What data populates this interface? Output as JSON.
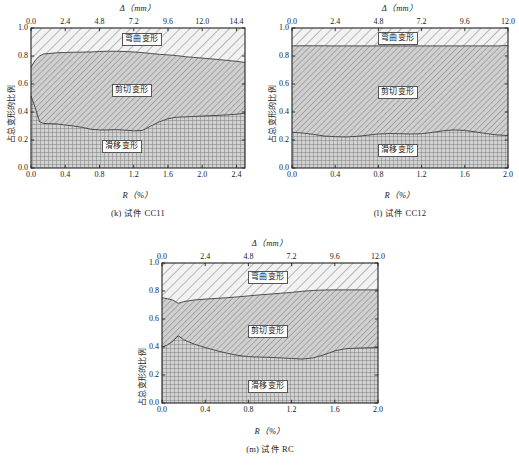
{
  "figure": {
    "panels": [
      {
        "id": "panel-k",
        "caption": "(k) 试件 CC11",
        "top_axis_title": "Δ（mm）",
        "bottom_axis_title": "R（%）",
        "y_axis_title": "占总变形的比例",
        "top_ticks": [
          "0.0",
          "2.4",
          "4.8",
          "7.2",
          "9.6",
          "12.0",
          "14.4"
        ],
        "bottom_ticks": [
          "0.0",
          "0.4",
          "0.8",
          "1.2",
          "1.6",
          "2.0",
          "2.4"
        ],
        "y_ticks": [
          "0.0",
          "0.2",
          "0.4",
          "0.6",
          "0.8",
          "1.0"
        ],
        "region_labels": {
          "top": "弯曲变形",
          "middle": "剪切变形",
          "bottom": "滑移变形"
        }
      },
      {
        "id": "panel-l",
        "caption": "(l) 试件 CC12",
        "top_axis_title": "Δ（mm）",
        "bottom_axis_title": "R（%）",
        "y_axis_title": "占总变形的比例",
        "top_ticks": [
          "0.0",
          "2.4",
          "4.8",
          "7.2",
          "9.6",
          "12.0"
        ],
        "bottom_ticks": [
          "0.0",
          "0.4",
          "0.8",
          "1.2",
          "1.6",
          "2.0"
        ],
        "y_ticks": [
          "0.0",
          "0.2",
          "0.4",
          "0.6",
          "0.8",
          "1.0"
        ],
        "region_labels": {
          "top": "弯曲变形",
          "middle": "剪切变形",
          "bottom": "滑移变形"
        }
      },
      {
        "id": "panel-m",
        "caption": "(m) 试件 RC",
        "top_axis_title": "Δ（mm）",
        "bottom_axis_title": "R（%）",
        "y_axis_title": "占总变形的比例",
        "top_ticks": [
          "0.0",
          "2.4",
          "4.8",
          "7.2",
          "9.6",
          "12.0"
        ],
        "bottom_ticks": [
          "0.0",
          "0.4",
          "0.8",
          "1.2",
          "1.6",
          "2.0"
        ],
        "y_ticks": [
          "0.0",
          "0.2",
          "0.4",
          "0.6",
          "0.8",
          "1.0"
        ],
        "region_labels": {
          "top": "弯曲变形",
          "middle": "剪切变形",
          "bottom": "滑移变形"
        }
      }
    ]
  },
  "colors": {
    "slip_fill": "#c9c9c9",
    "shear_fill": "#bdbdbd",
    "bend_fill": "#ececec",
    "axis": "#222222",
    "hatch": "#6f6f6f"
  },
  "chart_data": [
    {
      "type": "area",
      "title": "(k) 试件 CC11",
      "xlabel": "R（%）",
      "ylabel": "占总变形的比例",
      "top_xlabel": "Δ（mm）",
      "xlim": [
        0.0,
        2.5
      ],
      "ylim": [
        0.0,
        1.0
      ],
      "top_xlim": [
        0.0,
        15.0
      ],
      "grid": false,
      "legend": "inline-region-labels",
      "x": [
        0.0,
        0.05,
        0.1,
        0.15,
        0.2,
        0.3,
        0.4,
        0.5,
        0.6,
        0.7,
        0.8,
        0.9,
        1.0,
        1.1,
        1.2,
        1.3,
        1.4,
        1.5,
        1.6,
        1.7,
        1.8,
        1.9,
        2.0,
        2.1,
        2.2,
        2.3,
        2.4,
        2.5
      ],
      "series": [
        {
          "name": "滑移变形",
          "values": [
            0.515,
            0.43,
            0.33,
            0.318,
            0.317,
            0.315,
            0.307,
            0.3,
            0.29,
            0.277,
            0.272,
            0.272,
            0.274,
            0.27,
            0.266,
            0.268,
            0.3,
            0.33,
            0.352,
            0.363,
            0.365,
            0.368,
            0.371,
            0.374,
            0.376,
            0.38,
            0.384,
            0.392
          ]
        },
        {
          "name": "剪切变形",
          "values": [
            0.205,
            0.34,
            0.47,
            0.497,
            0.5,
            0.508,
            0.518,
            0.527,
            0.538,
            0.552,
            0.56,
            0.562,
            0.56,
            0.562,
            0.563,
            0.556,
            0.518,
            0.482,
            0.456,
            0.44,
            0.43,
            0.422,
            0.414,
            0.406,
            0.398,
            0.388,
            0.378,
            0.362
          ]
        },
        {
          "name": "弯曲变形",
          "values": [
            0.28,
            0.23,
            0.2,
            0.185,
            0.183,
            0.177,
            0.175,
            0.173,
            0.172,
            0.171,
            0.168,
            0.166,
            0.166,
            0.168,
            0.171,
            0.176,
            0.182,
            0.188,
            0.192,
            0.197,
            0.205,
            0.21,
            0.215,
            0.22,
            0.226,
            0.232,
            0.238,
            0.246
          ]
        }
      ]
    },
    {
      "type": "area",
      "title": "(l) 试件 CC12",
      "xlabel": "R（%）",
      "ylabel": "占总变形的比例",
      "top_xlabel": "Δ（mm）",
      "xlim": [
        0.0,
        2.0
      ],
      "ylim": [
        0.0,
        1.0
      ],
      "top_xlim": [
        0.0,
        12.0
      ],
      "grid": false,
      "legend": "inline-region-labels",
      "x": [
        0.0,
        0.1,
        0.2,
        0.3,
        0.4,
        0.5,
        0.6,
        0.7,
        0.8,
        0.9,
        1.0,
        1.1,
        1.2,
        1.3,
        1.4,
        1.5,
        1.6,
        1.7,
        1.8,
        1.9,
        2.0
      ],
      "series": [
        {
          "name": "滑移变形",
          "values": [
            0.255,
            0.25,
            0.24,
            0.228,
            0.224,
            0.222,
            0.226,
            0.234,
            0.243,
            0.246,
            0.245,
            0.243,
            0.245,
            0.254,
            0.266,
            0.272,
            0.268,
            0.258,
            0.246,
            0.236,
            0.232
          ]
        },
        {
          "name": "剪切变形",
          "values": [
            0.617,
            0.623,
            0.633,
            0.645,
            0.648,
            0.65,
            0.646,
            0.638,
            0.629,
            0.626,
            0.627,
            0.629,
            0.627,
            0.618,
            0.606,
            0.6,
            0.604,
            0.614,
            0.626,
            0.636,
            0.643
          ]
        },
        {
          "name": "弯曲变形",
          "values": [
            0.128,
            0.127,
            0.127,
            0.127,
            0.128,
            0.128,
            0.128,
            0.128,
            0.128,
            0.128,
            0.128,
            0.128,
            0.128,
            0.128,
            0.128,
            0.128,
            0.128,
            0.128,
            0.128,
            0.128,
            0.125
          ]
        }
      ]
    },
    {
      "type": "area",
      "title": "(m) 试件 RC",
      "xlabel": "R（%）",
      "ylabel": "占总变形的比例",
      "top_xlabel": "Δ（mm）",
      "xlim": [
        0.0,
        2.0
      ],
      "ylim": [
        0.0,
        1.0
      ],
      "top_xlim": [
        0.0,
        12.0
      ],
      "grid": false,
      "legend": "inline-region-labels",
      "x": [
        0.0,
        0.05,
        0.1,
        0.15,
        0.2,
        0.3,
        0.4,
        0.5,
        0.6,
        0.7,
        0.8,
        0.9,
        1.0,
        1.1,
        1.2,
        1.3,
        1.4,
        1.5,
        1.6,
        1.7,
        1.8,
        1.9,
        2.0
      ],
      "series": [
        {
          "name": "滑移变形",
          "values": [
            0.4,
            0.415,
            0.44,
            0.48,
            0.452,
            0.42,
            0.396,
            0.375,
            0.356,
            0.34,
            0.331,
            0.328,
            0.326,
            0.322,
            0.318,
            0.314,
            0.322,
            0.345,
            0.372,
            0.388,
            0.392,
            0.394,
            0.396
          ]
        },
        {
          "name": "剪切变形",
          "values": [
            0.352,
            0.33,
            0.296,
            0.232,
            0.272,
            0.316,
            0.346,
            0.372,
            0.396,
            0.418,
            0.434,
            0.444,
            0.452,
            0.462,
            0.472,
            0.484,
            0.482,
            0.462,
            0.436,
            0.42,
            0.416,
            0.414,
            0.412
          ]
        },
        {
          "name": "弯曲变形",
          "values": [
            0.248,
            0.255,
            0.264,
            0.288,
            0.276,
            0.264,
            0.258,
            0.253,
            0.248,
            0.242,
            0.235,
            0.228,
            0.222,
            0.216,
            0.21,
            0.202,
            0.196,
            0.193,
            0.192,
            0.192,
            0.192,
            0.192,
            0.192
          ]
        }
      ]
    }
  ]
}
